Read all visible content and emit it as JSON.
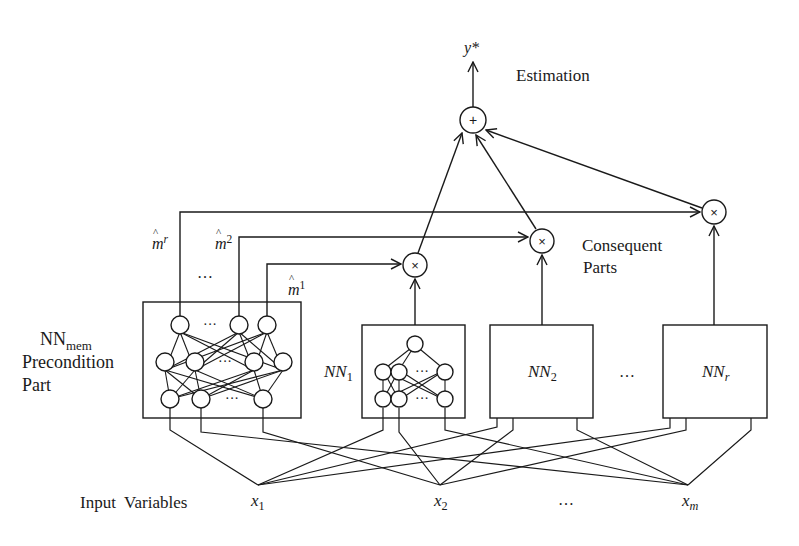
{
  "diagram": {
    "output": {
      "label": "y*",
      "node_symbol": "+",
      "caption": "Estimation"
    },
    "consequent": {
      "caption_line1": "Consequent",
      "caption_line2": "Parts",
      "multiplier_symbol": "×",
      "networks": [
        {
          "name": "NN",
          "index": "1"
        },
        {
          "name": "NN",
          "index": "2"
        },
        {
          "name": "NN",
          "index": "r"
        }
      ],
      "ellipsis": "…"
    },
    "precondition": {
      "title_main": "NN",
      "title_sub": "mem",
      "line2": "Precondition",
      "line3": "Part",
      "membership_outputs": [
        {
          "symbol": "m",
          "sup": "r"
        },
        {
          "symbol": "m",
          "sup": "2"
        },
        {
          "symbol": "m",
          "sup": "1"
        }
      ],
      "ellipsis": "…"
    },
    "inputs": {
      "label": "Input  Variables",
      "variables": [
        {
          "symbol": "x",
          "index": "1"
        },
        {
          "symbol": "x",
          "index": "2"
        },
        {
          "symbol": "x",
          "index": "m"
        }
      ],
      "ellipsis": "…"
    },
    "colors": {
      "line": "#1a1a1a",
      "background": "#ffffff"
    }
  }
}
